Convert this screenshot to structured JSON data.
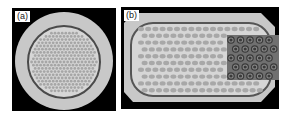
{
  "figure": {
    "panels": [
      {
        "id": "a",
        "label": "(a)",
        "description": "Circular cross-section with hexagonally packed filaments inside a dark ring"
      },
      {
        "id": "b",
        "label": "(b)",
        "description": "Rounded-rectangle cross-section with deformed elongated filaments; magnified inset at right showing filaments with concentric ring structure"
      }
    ],
    "colors": {
      "background": "#000000",
      "outer_sheath": "#c8c8c8",
      "inner_matrix": "#d8d8d8",
      "barrier_ring": "#555555",
      "filament": "#a8a8a8",
      "inset_bg": "#6e6e6e",
      "inset_filament": "#3a3a3a"
    }
  }
}
